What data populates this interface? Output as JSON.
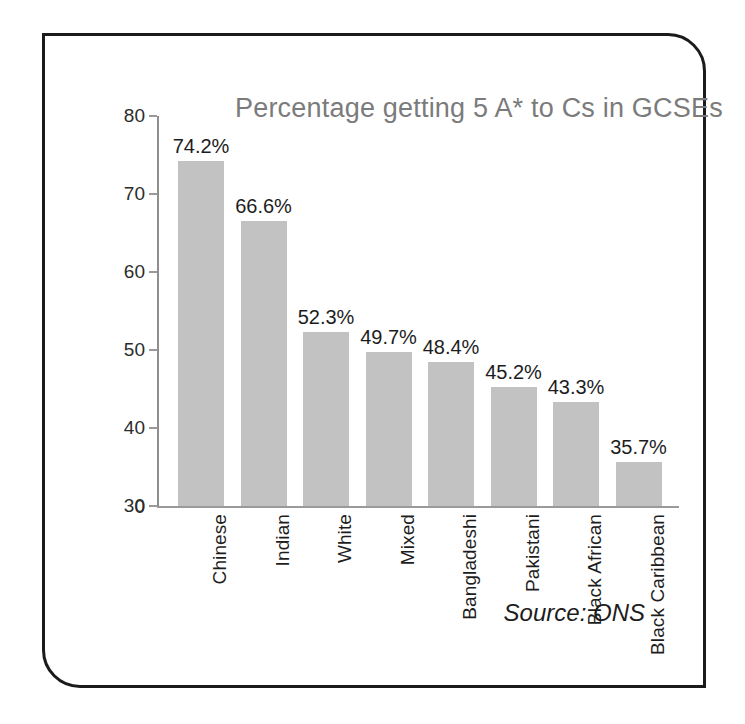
{
  "figure": {
    "frame_color": "#1b1b1b",
    "background": "#ffffff"
  },
  "source_note": "Source: ONS",
  "chart_data": {
    "type": "bar",
    "title": "Percentage getting 5 A* to Cs in GCSEs",
    "xlabel": "",
    "ylabel": "",
    "categories": [
      "Chinese",
      "Indian",
      "White",
      "Mixed",
      "Bangladeshi",
      "Pakistani",
      "Black African",
      "Black Caribbean"
    ],
    "values": [
      74.2,
      66.6,
      52.3,
      49.7,
      48.4,
      45.2,
      43.3,
      35.7
    ],
    "value_labels": [
      "74.2%",
      "66.6%",
      "52.3%",
      "49.7%",
      "48.4%",
      "45.2%",
      "43.3%",
      "35.7%"
    ],
    "ytick_labels": [
      "80",
      "70",
      "60",
      "50",
      "40",
      "30",
      "0"
    ],
    "ytick_values": [
      80,
      70,
      60,
      50,
      40,
      30,
      0
    ],
    "ylim": [
      30,
      80
    ],
    "axis_break": true,
    "axis_break_note": "y-axis starts at 30; a 0 label is drawn at the baseline",
    "grid": false,
    "legend": false,
    "bar_color": "#c2c2c2",
    "title_color": "#7b7b7b"
  }
}
